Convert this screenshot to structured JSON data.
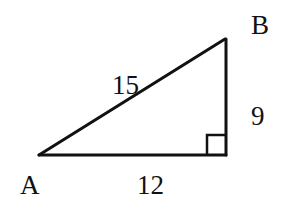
{
  "diagram": {
    "type": "right-triangle",
    "vertices": [
      {
        "name": "A",
        "label": "A",
        "x": 39,
        "y": 155
      },
      {
        "name": "B",
        "label": "B",
        "x": 225,
        "y": 39
      },
      {
        "name": "C",
        "label": "",
        "x": 226,
        "y": 155
      }
    ],
    "sides": {
      "hypotenuse_AB": {
        "label": "15"
      },
      "base_AC": {
        "label": "12"
      },
      "leg_BC": {
        "label": "9"
      }
    },
    "right_angle_at": "C",
    "colors": {
      "stroke": "#111111",
      "background": "#ffffff"
    }
  }
}
